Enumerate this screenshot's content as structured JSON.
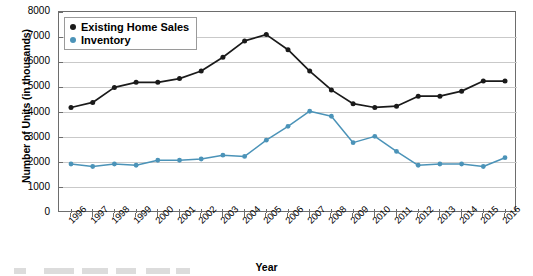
{
  "chart_data": {
    "type": "line",
    "title": "",
    "xlabel": "Year",
    "ylabel": "Number of Units (in thousands)",
    "categories": [
      "1996",
      "1997",
      "1998",
      "1999",
      "2000",
      "2001",
      "2002",
      "2003",
      "2004",
      "2005",
      "2006",
      "2007",
      "2008",
      "2009",
      "2010",
      "2011",
      "2012",
      "2013",
      "2014",
      "2015",
      "2016"
    ],
    "x": [
      1996,
      1997,
      1998,
      1999,
      2000,
      2001,
      2002,
      2003,
      2004,
      2005,
      2006,
      2007,
      2008,
      2009,
      2010,
      2011,
      2012,
      2013,
      2014,
      2015,
      2016
    ],
    "ylim": [
      0,
      8000
    ],
    "yticks": [
      0,
      1000,
      2000,
      3000,
      4000,
      5000,
      6000,
      7000,
      8000
    ],
    "ytick_labels": [
      "0",
      "1000",
      "2000",
      "3000",
      "4000",
      "5000",
      "6000",
      "7000",
      "8000"
    ],
    "grid": "horizontal",
    "legend_position": "top-left",
    "series": [
      {
        "name": "Existing Home Sales",
        "color": "#1a1a1a",
        "marker": "circle",
        "values": [
          4200,
          4400,
          5000,
          5200,
          5200,
          5350,
          5650,
          6200,
          6850,
          7100,
          6500,
          5650,
          4900,
          4350,
          4200,
          4250,
          4650,
          4650,
          4850,
          5250,
          5250
        ]
      },
      {
        "name": "Inventory",
        "color": "#4b93b8",
        "marker": "circle",
        "values": [
          1950,
          1850,
          1950,
          1900,
          2100,
          2100,
          2150,
          2300,
          2250,
          2900,
          3450,
          4050,
          3850,
          2800,
          3050,
          2450,
          1900,
          1950,
          1950,
          1850,
          2200
        ]
      }
    ]
  },
  "legend": {
    "items": [
      {
        "label": "Existing Home Sales",
        "color": "#1a1a1a"
      },
      {
        "label": "Inventory",
        "color": "#4b93b8"
      }
    ]
  },
  "axes": {
    "y_title": "Number of Units (in thousands)",
    "x_title": "Year"
  },
  "colors": {
    "series_black": "#1a1a1a",
    "series_blue": "#4b93b8",
    "gridline": "#c9c9c9",
    "axis": "#6d6d6d",
    "background": "#ffffff"
  }
}
